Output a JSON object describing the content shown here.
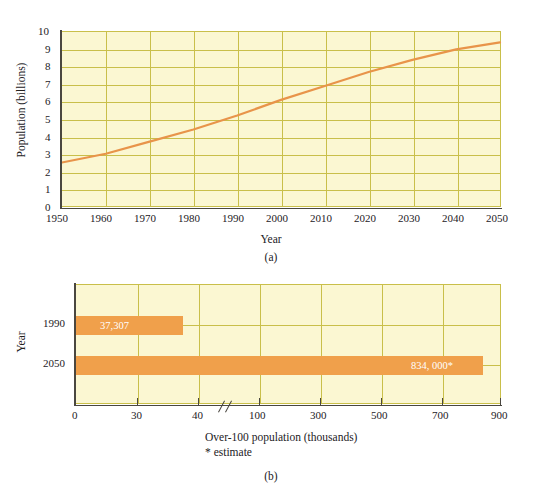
{
  "figure": {
    "captions": {
      "a": "(a)",
      "b": "(b)"
    }
  },
  "chart_data": [
    {
      "id": "chart-a",
      "type": "line",
      "title": "",
      "xlabel": "Year",
      "ylabel": "Population (billions)",
      "xlim": [
        1950,
        2050
      ],
      "ylim": [
        0,
        10
      ],
      "grid": true,
      "legend": "none",
      "xticks": [
        "1950",
        "1960",
        "1970",
        "1980",
        "1990",
        "2000",
        "2010",
        "2020",
        "2030",
        "2040",
        "2050"
      ],
      "yticks": [
        "0",
        "1",
        "2",
        "3",
        "4",
        "5",
        "6",
        "7",
        "8",
        "9",
        "10"
      ],
      "x": [
        1950,
        1960,
        1970,
        1980,
        1990,
        2000,
        2010,
        2020,
        2030,
        2040,
        2050
      ],
      "values": [
        2.5,
        3.0,
        3.7,
        4.4,
        5.2,
        6.1,
        6.9,
        7.7,
        8.4,
        9.0,
        9.4
      ],
      "series_color": "#e8944a"
    },
    {
      "id": "chart-b",
      "type": "bar",
      "orientation": "horizontal",
      "title": "",
      "xlabel": "Over-100 population (thousands)",
      "xlabel_note": "* estimate",
      "ylabel": "Year",
      "grid": true,
      "legend": "none",
      "axis_break": true,
      "axis_break_after": "40",
      "xticks": [
        "0",
        "30",
        "40",
        "100",
        "300",
        "500",
        "700",
        "900"
      ],
      "categories": [
        "1990",
        "2050"
      ],
      "values": [
        37.307,
        834.0
      ],
      "value_labels": [
        "37,307",
        "834, 000*"
      ],
      "bar_color": "#f0a04b"
    }
  ]
}
